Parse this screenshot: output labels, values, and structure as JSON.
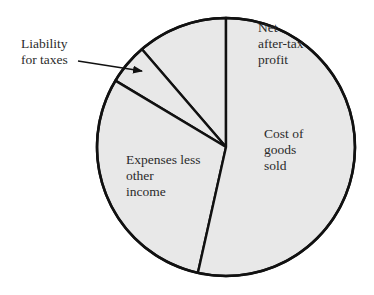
{
  "chart_data": {
    "type": "pie",
    "title": "",
    "start_angle_deg_from_top": 0,
    "direction": "counterclockwise",
    "slices": [
      {
        "label": "Net after-tax profit",
        "value": 11.3
      },
      {
        "label": "Liability for taxes",
        "value": 5.1
      },
      {
        "label": "Expenses less other income",
        "value": 30.1
      },
      {
        "label": "Cost of goods sold",
        "value": 53.5
      }
    ],
    "fill_color": "#e8e8e8",
    "stroke_color": "#111111",
    "annotations": [
      {
        "text": "Liability for taxes",
        "type": "arrow-callout",
        "target": "Liability for taxes"
      }
    ]
  },
  "labels": {
    "net_profit": [
      "Net",
      "after-tax",
      "profit"
    ],
    "liability": [
      "Liability",
      "for taxes"
    ],
    "expenses": [
      "Expenses less",
      "other",
      "income"
    ],
    "cogs": [
      "Cost of",
      "goods",
      "sold"
    ]
  }
}
